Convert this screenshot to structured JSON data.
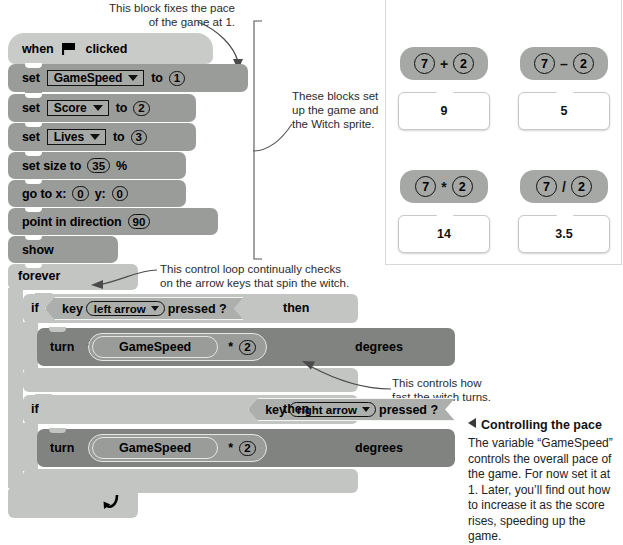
{
  "annotations": {
    "top_note": "This block fixes the pace\nof the game at 1.",
    "setup_note": "These blocks set\nup the game and\nthe Witch sprite.",
    "loop_note": "This control loop continually checks\non the arrow keys that spin the witch.",
    "speed_note": "This controls how\nfast the witch turns."
  },
  "script": {
    "hat": {
      "when": "when",
      "clicked": "clicked",
      "icon": "green-flag-icon"
    },
    "blocks": [
      {
        "type": "set-variable",
        "label": "set",
        "variable": "GameSpeed",
        "to": "to",
        "value": "1"
      },
      {
        "type": "set-variable",
        "label": "set",
        "variable": "Score",
        "to": "to",
        "value": "2"
      },
      {
        "type": "set-variable",
        "label": "set",
        "variable": "Lives",
        "to": "to",
        "value": "3"
      },
      {
        "type": "set-size",
        "label_before": "set size to",
        "value": "35",
        "label_after": "%"
      },
      {
        "type": "go-to-xy",
        "label_x": "go to x:",
        "x": "0",
        "label_y": "y:",
        "y": "0"
      },
      {
        "type": "point-in-direction",
        "label": "point in direction",
        "value": "90"
      },
      {
        "type": "show",
        "label": "show"
      }
    ],
    "forever": {
      "label": "forever",
      "loop_icon": "loop-arrow-icon"
    },
    "branches": [
      {
        "if_label": "if",
        "key_label": "key",
        "key": "left arrow",
        "pressed_label": "pressed ?",
        "then_label": "then",
        "turn_label": "turn",
        "turn_icon": "turn-counterclockwise-icon",
        "reporter": "GameSpeed",
        "operator": "*",
        "operand": "2",
        "degrees_label": "degrees"
      },
      {
        "if_label": "if",
        "key_label": "key",
        "key": "right arrow",
        "pressed_label": "pressed ?",
        "then_label": "then",
        "turn_label": "turn",
        "turn_icon": "turn-clockwise-icon",
        "reporter": "GameSpeed",
        "operator": "*",
        "operand": "2",
        "degrees_label": "degrees"
      }
    ]
  },
  "operator_panel": {
    "items": [
      {
        "left": "7",
        "symbol": "+",
        "right": "2",
        "result": "9"
      },
      {
        "left": "7",
        "symbol": "–",
        "right": "2",
        "result": "5"
      },
      {
        "left": "7",
        "symbol": "*",
        "right": "2",
        "result": "14"
      },
      {
        "left": "7",
        "symbol": "/",
        "right": "2",
        "result": "3.5"
      }
    ]
  },
  "caption": {
    "title": "Controlling the pace",
    "body": "The variable “GameSpeed” controls the overall pace of the game. For now set it at 1. Later, you’ll find out how to increase it as the score rises, speeding up the game."
  },
  "colors": {
    "event_block": "#c9cbc9",
    "data_block": "#9a9c9a",
    "control_block": "#c3c5c3",
    "sensing_block": "#adafad",
    "motion_block": "#818381",
    "operator_block": "#a6a8a6",
    "text": "#000000"
  }
}
